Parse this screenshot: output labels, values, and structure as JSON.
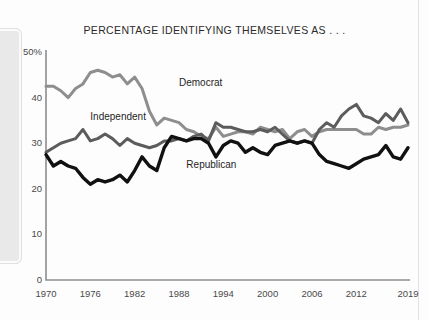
{
  "chart_data": {
    "type": "line",
    "title": "PERCENTAGE IDENTIFYING THEMSELVES AS . . .",
    "xlabel": "",
    "ylabel": "",
    "xlim": [
      1970,
      2019
    ],
    "ylim": [
      0,
      50
    ],
    "grid": false,
    "legend_position": "inline-labels",
    "x_ticks": [
      "1970",
      "1976",
      "1982",
      "1988",
      "1994",
      "2000",
      "2006",
      "2012",
      "2019"
    ],
    "x_tick_values": [
      1970,
      1976,
      1982,
      1988,
      1994,
      2000,
      2006,
      2012,
      2019
    ],
    "y_ticks": [
      "0",
      "10",
      "20",
      "30",
      "40",
      "50%"
    ],
    "y_tick_values": [
      0,
      10,
      20,
      30,
      40,
      50
    ],
    "x": [
      1970,
      1971,
      1972,
      1973,
      1974,
      1975,
      1976,
      1977,
      1978,
      1979,
      1980,
      1981,
      1982,
      1983,
      1984,
      1985,
      1986,
      1987,
      1988,
      1989,
      1990,
      1991,
      1992,
      1993,
      1994,
      1995,
      1996,
      1997,
      1998,
      1999,
      2000,
      2001,
      2002,
      2003,
      2004,
      2005,
      2006,
      2007,
      2008,
      2009,
      2010,
      2011,
      2012,
      2013,
      2014,
      2015,
      2016,
      2017,
      2018,
      2019
    ],
    "series": [
      {
        "name": "Democrat",
        "color": "#8e8e8e",
        "label_x": 1988,
        "label_y": 43,
        "values": [
          42.5,
          42.5,
          41.5,
          40.0,
          42.0,
          43.0,
          45.5,
          46.0,
          45.5,
          44.5,
          45.0,
          43.0,
          44.5,
          42.0,
          37.0,
          34.0,
          35.5,
          35.0,
          34.5,
          33.0,
          32.5,
          31.5,
          31.0,
          33.5,
          31.5,
          32.0,
          32.5,
          32.5,
          32.0,
          33.5,
          33.0,
          32.5,
          33.0,
          31.0,
          32.5,
          33.0,
          31.5,
          32.5,
          33.0,
          33.0,
          33.0,
          33.0,
          33.0,
          32.0,
          32.0,
          33.5,
          33.0,
          33.5,
          33.5,
          34.0
        ]
      },
      {
        "name": "Independent",
        "color": "#5c5c5c",
        "label_x": 1976,
        "label_y": 35.5,
        "values": [
          28.0,
          29.0,
          30.0,
          30.5,
          31.0,
          33.0,
          30.5,
          31.0,
          32.0,
          31.0,
          29.5,
          31.0,
          30.0,
          29.5,
          29.0,
          29.5,
          30.5,
          30.5,
          31.0,
          30.5,
          31.5,
          32.0,
          30.5,
          34.5,
          33.5,
          33.5,
          33.0,
          32.5,
          32.5,
          33.0,
          32.5,
          33.5,
          32.0,
          30.5,
          30.0,
          30.5,
          30.0,
          33.0,
          34.5,
          33.5,
          36.0,
          37.5,
          38.5,
          36.0,
          35.5,
          34.5,
          36.5,
          35.0,
          37.5,
          34.5
        ]
      },
      {
        "name": "Republican",
        "color": "#111111",
        "label_x": 1989,
        "label_y": 25,
        "values": [
          27.5,
          25.0,
          26.0,
          25.0,
          24.5,
          22.5,
          21.0,
          22.0,
          21.5,
          22.0,
          23.0,
          21.5,
          24.0,
          27.0,
          25.0,
          24.0,
          29.0,
          31.5,
          31.0,
          30.5,
          31.0,
          31.0,
          30.0,
          27.0,
          29.5,
          30.5,
          30.0,
          28.0,
          29.0,
          28.0,
          27.5,
          29.5,
          30.0,
          30.5,
          30.0,
          30.5,
          30.0,
          27.5,
          26.0,
          25.5,
          25.0,
          24.5,
          25.5,
          26.5,
          27.0,
          27.5,
          29.5,
          27.0,
          26.5,
          29.0
        ]
      }
    ]
  }
}
